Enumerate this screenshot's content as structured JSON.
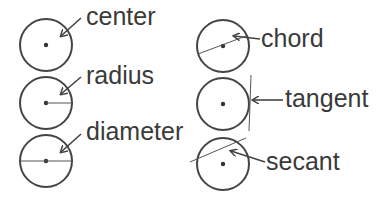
{
  "diagram": {
    "colors": {
      "stroke": "#444444",
      "text": "#3a3a3a",
      "background": "#ffffff"
    },
    "items": [
      {
        "id": "center",
        "label": "center",
        "feature": "center point"
      },
      {
        "id": "radius",
        "label": "radius",
        "feature": "line from center to edge"
      },
      {
        "id": "diameter",
        "label": "diameter",
        "feature": "line through center edge to edge"
      },
      {
        "id": "chord",
        "label": "chord",
        "feature": "line segment joining two points on circle"
      },
      {
        "id": "tangent",
        "label": "tangent",
        "feature": "line touching circle at one point"
      },
      {
        "id": "secant",
        "label": "secant",
        "feature": "line cutting circle at two points"
      }
    ]
  }
}
